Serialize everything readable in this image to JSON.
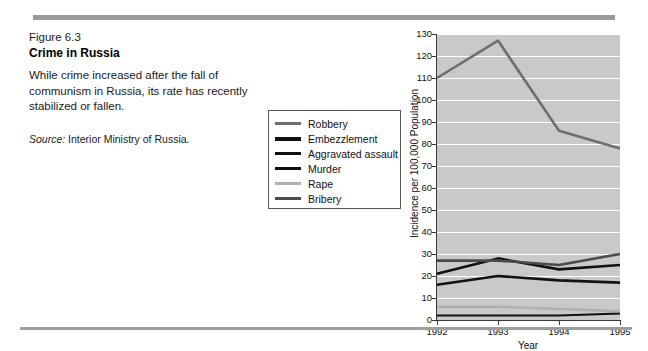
{
  "figure": {
    "number": "Figure 6.3",
    "title": "Crime in Russia",
    "description": "While crime increased after the fall of communism in Russia, its rate has recently stabilized or fallen.",
    "source_label": "Source:",
    "source_text": " Interior Ministry of Russia."
  },
  "colors": {
    "plot_background": "#c9c9c9",
    "gridline": "#ffffff",
    "axis": "#3a3a3a",
    "rule": "#9a9a9a",
    "robbery": "#6e6e6e",
    "embezzlement": "#111111",
    "aggravated_assault": "#111111",
    "murder": "#111111",
    "rape": "#b0b0b0",
    "bribery": "#4a4a4a"
  },
  "legend": {
    "items": [
      {
        "label": "Robbery",
        "color": "#6e6e6e",
        "weight": 3
      },
      {
        "label": "Embezzlement",
        "color": "#111111",
        "weight": 4
      },
      {
        "label": "Aggravated assault",
        "color": "#111111",
        "weight": 3
      },
      {
        "label": "Murder",
        "color": "#111111",
        "weight": 3
      },
      {
        "label": "Rape",
        "color": "#b0b0b0",
        "weight": 3
      },
      {
        "label": "Bribery",
        "color": "#4a4a4a",
        "weight": 3
      }
    ]
  },
  "chart_data": {
    "type": "line",
    "title": "Crime in Russia",
    "xlabel": "Year",
    "ylabel": "Incidence per 100,000 Population",
    "categories": [
      "1992",
      "1993",
      "1994",
      "1995"
    ],
    "x": [
      1992,
      1993,
      1994,
      1995
    ],
    "xlim": [
      1992,
      1995
    ],
    "ylim": [
      0,
      130
    ],
    "yticks": [
      0,
      10,
      20,
      30,
      40,
      50,
      60,
      70,
      80,
      90,
      100,
      110,
      120,
      130
    ],
    "grid": "horizontal",
    "legend_position": "outside-left",
    "series": [
      {
        "name": "Robbery",
        "color": "#6e6e6e",
        "width": 2.6,
        "values": [
          110,
          127,
          86,
          78
        ]
      },
      {
        "name": "Embezzlement",
        "color": "#111111",
        "width": 2.6,
        "values": [
          21,
          28,
          23,
          25
        ]
      },
      {
        "name": "Aggravated assault",
        "color": "#111111",
        "width": 2.6,
        "values": [
          16,
          20,
          18,
          17
        ]
      },
      {
        "name": "Murder",
        "color": "#111111",
        "width": 2.0,
        "values": [
          2,
          2,
          2,
          3
        ]
      },
      {
        "name": "Rape",
        "color": "#b0b0b0",
        "width": 2.4,
        "values": [
          6,
          6,
          5,
          4
        ]
      },
      {
        "name": "Bribery",
        "color": "#4a4a4a",
        "width": 2.6,
        "values": [
          27,
          27,
          25,
          30
        ]
      }
    ]
  }
}
